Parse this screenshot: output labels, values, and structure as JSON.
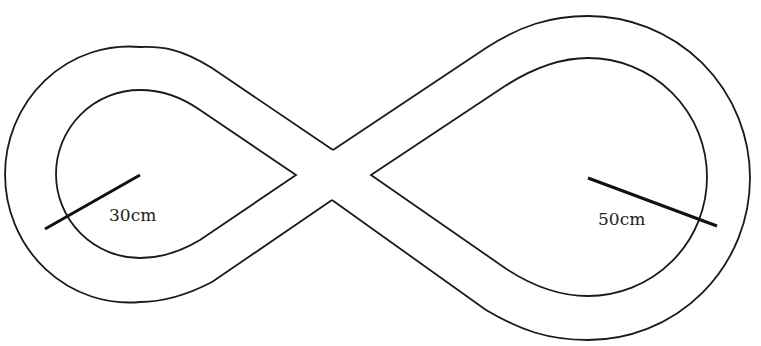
{
  "diagram": {
    "type": "figure-eight track",
    "left_loop": {
      "radius_label": "30cm"
    },
    "right_loop": {
      "radius_label": "50cm"
    }
  },
  "colors": {
    "stroke": "#1a1a1a",
    "background": "#ffffff"
  }
}
